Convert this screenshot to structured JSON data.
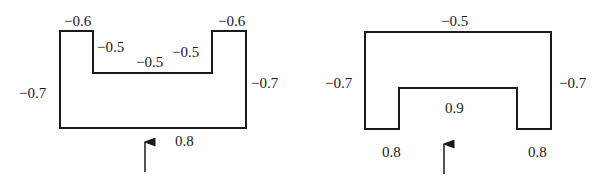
{
  "diagrams": [
    {
      "name": "u-shape-open-top",
      "outline_points": "60,31 93,31 93,73 212,73 212,31 246,31 246,128 60,128",
      "labels": [
        {
          "text": "−0.6",
          "x": 64,
          "y": 26
        },
        {
          "text": "−0.6",
          "x": 218,
          "y": 26
        },
        {
          "text": "−0.5",
          "x": 97,
          "y": 52
        },
        {
          "text": "−0.5",
          "x": 172,
          "y": 57
        },
        {
          "text": "−0.5",
          "x": 136,
          "y": 67
        },
        {
          "text": "−0.7",
          "x": 19,
          "y": 98
        },
        {
          "text": "−0.7",
          "x": 251,
          "y": 88
        },
        {
          "text": "0.8",
          "x": 175,
          "y": 146
        }
      ],
      "arrow": {
        "x": 145,
        "y1": 172,
        "y2": 142
      }
    },
    {
      "name": "u-shape-open-bottom",
      "outline_points": "365,32 551,32 551,129 517,129 517,88 399,88 399,129 365,129",
      "labels": [
        {
          "text": "−0.5",
          "x": 441,
          "y": 26
        },
        {
          "text": "−0.7",
          "x": 325,
          "y": 88
        },
        {
          "text": "−0.7",
          "x": 559,
          "y": 88
        },
        {
          "text": "0.9",
          "x": 445,
          "y": 113
        },
        {
          "text": "0.8",
          "x": 382,
          "y": 157
        },
        {
          "text": "0.8",
          "x": 528,
          "y": 157
        }
      ],
      "arrow": {
        "x": 444,
        "y1": 174,
        "y2": 144
      }
    }
  ]
}
